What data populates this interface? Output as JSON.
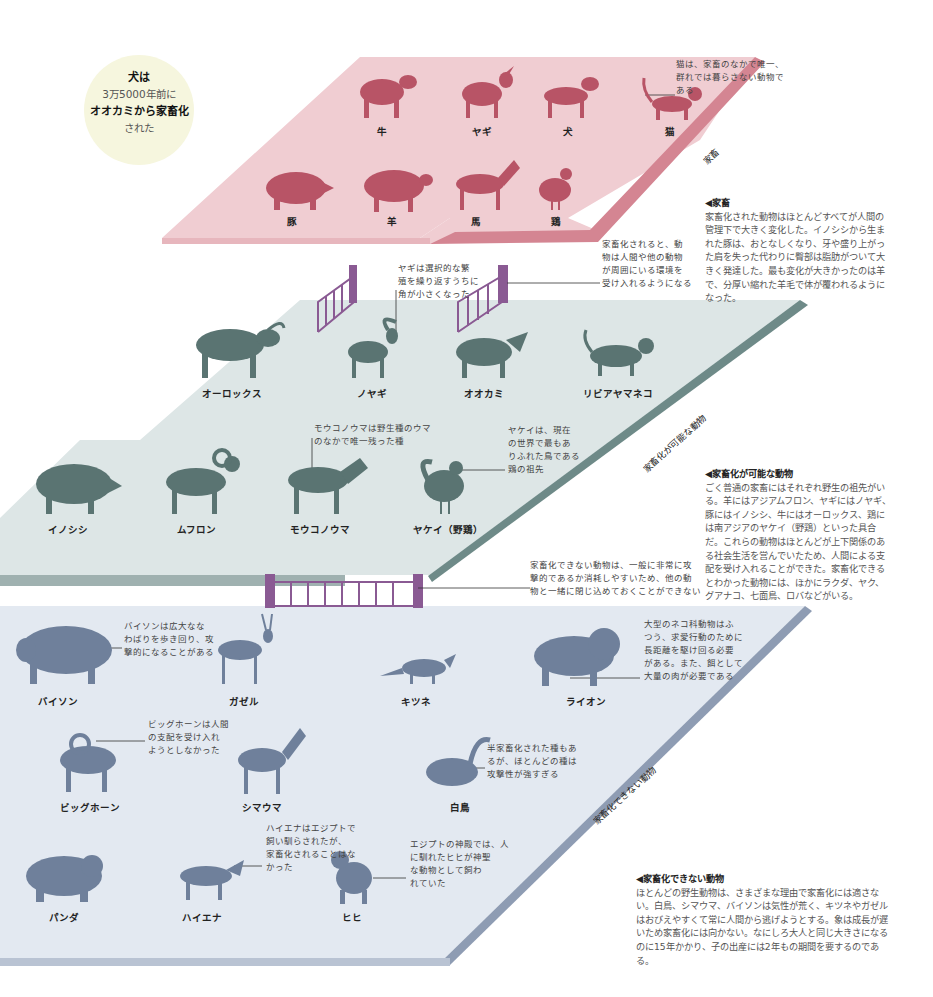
{
  "badge": {
    "line1": "犬は",
    "line2": "3万5000年前に",
    "line3": "オオカミから家畜化",
    "line4": "された"
  },
  "colors": {
    "domestic_plane": "#f0cdd2",
    "domestic_edge": "#d48592",
    "domestic_animal": "#b85466",
    "possible_plane": "#dde6e6",
    "possible_edge": "#6e8a88",
    "possible_animal": "#5a7472",
    "impossible_plane": "#e3e9f1",
    "impossible_edge": "#8e9cb3",
    "impossible_animal": "#6f809b",
    "fence": "#8a5a93"
  },
  "planes": {
    "domestic": {
      "label": "家畜",
      "animals": [
        {
          "name": "牛",
          "icon": "cow-icon"
        },
        {
          "name": "ヤギ",
          "icon": "goat-icon"
        },
        {
          "name": "犬",
          "icon": "dog-icon"
        },
        {
          "name": "猫",
          "icon": "cat-icon"
        },
        {
          "name": "豚",
          "icon": "pig-icon"
        },
        {
          "name": "羊",
          "icon": "sheep-icon"
        },
        {
          "name": "馬",
          "icon": "horse-icon"
        },
        {
          "name": "鶏",
          "icon": "chicken-icon"
        }
      ],
      "notes": {
        "cat": "猫は、家畜のなかで唯一、\n群れでは暮らさない動物で\nある",
        "fence_right": "家畜化されると、動\n物は人間や他の動物\nが周囲にいる環境を\n受け入れるようになる",
        "goat": "ヤギは選択的な繁\n殖を繰り返すうちに\n角が小さくなった"
      }
    },
    "possible": {
      "label": "家畜化が可能な動物",
      "animals": [
        {
          "name": "オーロックス",
          "icon": "aurochs-icon"
        },
        {
          "name": "ノヤギ",
          "icon": "wild-goat-icon"
        },
        {
          "name": "オオカミ",
          "icon": "wolf-icon"
        },
        {
          "name": "リビアヤマネコ",
          "icon": "wildcat-icon"
        },
        {
          "name": "イノシシ",
          "icon": "boar-icon"
        },
        {
          "name": "ムフロン",
          "icon": "mouflon-icon"
        },
        {
          "name": "モウコノウマ",
          "icon": "przewalski-horse-icon"
        },
        {
          "name": "ヤケイ（野鶏）",
          "icon": "junglefowl-icon"
        }
      ],
      "notes": {
        "horse": "モウコノウマは野生種のウマ\nのなかで唯一残った種",
        "junglefowl": "ヤケイは、現在\nの世界で最もあ\nりふれた鳥である\n鶏の祖先",
        "fence": "家畜化できない動物は、一般に非常に攻\n撃的であるか消耗しやすいため、他の動\n物と一緒に閉じ込めておくことができない"
      }
    },
    "impossible": {
      "label": "家畜化できない動物",
      "animals": [
        {
          "name": "バイソン",
          "icon": "bison-icon"
        },
        {
          "name": "ガゼル",
          "icon": "gazelle-icon"
        },
        {
          "name": "キツネ",
          "icon": "fox-icon"
        },
        {
          "name": "ライオン",
          "icon": "lion-icon"
        },
        {
          "name": "ビッグホーン",
          "icon": "bighorn-icon"
        },
        {
          "name": "シマウマ",
          "icon": "zebra-icon"
        },
        {
          "name": "白鳥",
          "icon": "swan-icon"
        },
        {
          "name": "パンダ",
          "icon": "panda-icon"
        },
        {
          "name": "ハイエナ",
          "icon": "hyena-icon"
        },
        {
          "name": "ヒヒ",
          "icon": "baboon-icon"
        }
      ],
      "notes": {
        "bison": "バイソンは広大なな\nわばりを歩き回り、攻\n撃的になることがある",
        "lion": "大型のネコ科動物はふ\nつう、求愛行動のために\n長距離を駆け回る必要\nがある。また、餌として\n大量の肉が必要である",
        "bighorn": "ビッグホーンは人間\nの支配を受け入れ\nようとしなかった",
        "swan": "半家畜化された種もあ\nるが、ほとんどの種は\n攻撃性が強すぎる",
        "hyena": "ハイエナはエジプトで\n飼い馴らされたが、\n家畜化されることはな\nかった",
        "baboon": "エジプトの神殿では、人\nに馴れたヒヒが神聖\nな動物として飼わ\nれていた"
      }
    }
  },
  "descriptions": {
    "domestic": {
      "title": "◀家畜",
      "body": "家畜化された動物はほとんどすべてが人間の管理下で大きく変化した。イノシシから生まれた豚は、おとなしくなり、牙や盛り上がった肩を失った代わりに臀部は脂肪がついて大きく発達した。最も変化が大きかったのは羊で、分厚い縮れた羊毛で体が覆われるようになった。"
    },
    "possible": {
      "title": "◀家畜化が可能な動物",
      "body": "ごく普通の家畜にはそれぞれ野生の祖先がいる。羊にはアジアムフロン、ヤギにはノヤギ、豚にはイノシシ、牛にはオーロックス、鶏には南アジアのヤケイ（野鶏）といった具合だ。これらの動物はほとんどが上下関係のある社会生活を営んでいたため、人間による支配を受け入れることができた。家畜化できるとわかった動物には、ほかにラクダ、ヤク、グアナコ、七面鳥、ロバなどがいる。"
    },
    "impossible": {
      "title": "◀家畜化できない動物",
      "body": "ほとんどの野生動物は、さまざまな理由で家畜化には適さない。白鳥、シマウマ、バイソンは気性が荒く、キツネやガゼルはおびえやすくて常に人間から逃げようとする。象は成長が遅いため家畜化には向かない。なにしろ大人と同じ大きさになるのに15年かかり、子の出産には2年もの期間を要するのである。"
    }
  }
}
